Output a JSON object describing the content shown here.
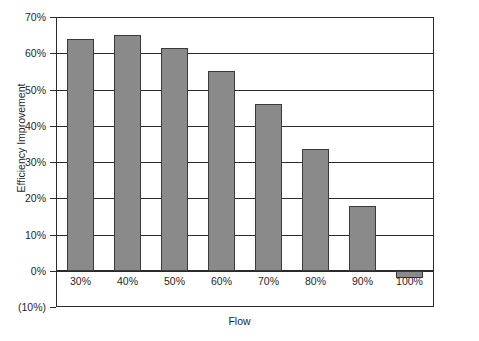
{
  "chart_data": {
    "type": "bar",
    "title": "",
    "xlabel": "Flow",
    "ylabel": "Efficiency Improvement",
    "categories": [
      "30%",
      "40%",
      "50%",
      "60%",
      "70%",
      "80%",
      "90%",
      "100%"
    ],
    "values": [
      64,
      65,
      61.5,
      55,
      46,
      33.5,
      18,
      -2
    ],
    "value_unit": "%",
    "ylim": [
      -10,
      70
    ],
    "ytick_labels": [
      "70%",
      "60%",
      "50%",
      "40%",
      "30%",
      "20%",
      "10%",
      "0%",
      "(10%)"
    ],
    "ytick_values": [
      70,
      60,
      50,
      40,
      30,
      20,
      10,
      0,
      -10
    ],
    "grid": true,
    "grid_axis": "y",
    "legend": null,
    "series": [
      {
        "name": "Efficiency Improvement",
        "values": [
          64,
          65,
          61.5,
          55,
          46,
          33.5,
          18,
          -2
        ],
        "color": "#8a8a8a",
        "edge_color": "#3a3a3a"
      }
    ]
  },
  "colors": {
    "bar_fill": "#8a8a8a",
    "bar_edge": "#3a3a3a",
    "axis": "#2b2b2b",
    "text": "#1f1f1f",
    "background": "#ffffff"
  }
}
